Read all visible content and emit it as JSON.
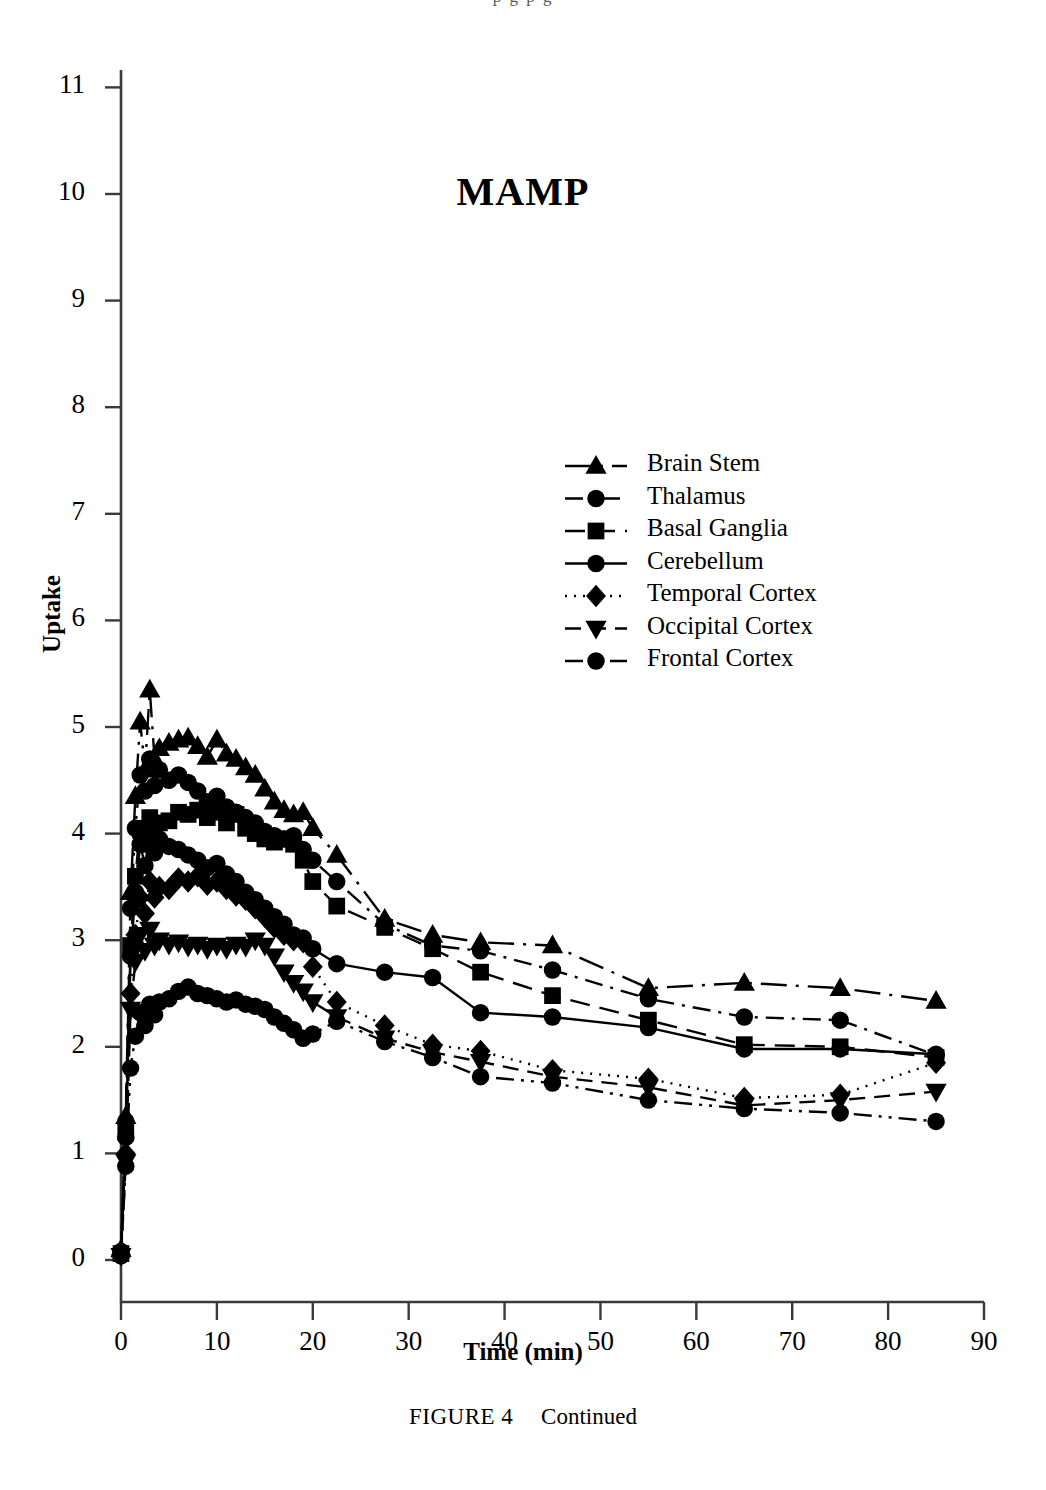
{
  "page": {
    "bleed_text": "p      g      p      g"
  },
  "figure": {
    "caption_label": "FIGURE 4",
    "caption_text": "Continued"
  },
  "chart_data": {
    "type": "line",
    "title": "MAMP",
    "xlabel": "Time (min)",
    "ylabel": "Uptake",
    "xlim": [
      0,
      90
    ],
    "ylim": [
      0,
      11.5
    ],
    "xticks": [
      0,
      10,
      20,
      30,
      40,
      50,
      60,
      70,
      80,
      90
    ],
    "yticks": [
      0,
      1,
      2,
      3,
      4,
      5,
      6,
      7,
      8,
      9,
      10,
      11
    ],
    "grid": false,
    "legend_position": "upper center",
    "color": "#000000",
    "series": [
      {
        "name": "Brain Stem",
        "marker": "triangle-up",
        "dash": "long-dash-dot",
        "x": [
          0,
          0.5,
          1,
          1.5,
          2,
          2.5,
          3,
          3.5,
          4,
          5,
          6,
          7,
          8,
          9,
          10,
          11,
          12,
          13,
          14,
          15,
          16,
          17,
          18,
          19,
          20,
          22.5,
          27.5,
          32.5,
          37.5,
          45,
          55,
          65,
          75,
          85
        ],
        "y": [
          0.1,
          1.35,
          3.45,
          4.35,
          5.05,
          4.6,
          5.35,
          4.7,
          4.8,
          4.85,
          4.88,
          4.9,
          4.82,
          4.72,
          4.88,
          4.75,
          4.7,
          4.62,
          4.55,
          4.42,
          4.3,
          4.22,
          4.18,
          4.2,
          4.05,
          3.8,
          3.2,
          3.05,
          2.98,
          2.95,
          2.55,
          2.6,
          2.55,
          2.43
        ]
      },
      {
        "name": "Thalamus",
        "marker": "circle",
        "dash": "dash-dot",
        "x": [
          0,
          0.5,
          1,
          1.5,
          2,
          2.5,
          3,
          3.5,
          4,
          5,
          6,
          7,
          8,
          9,
          10,
          11,
          12,
          13,
          14,
          15,
          16,
          17,
          18,
          19,
          20,
          22.5,
          27.5,
          32.5,
          37.5,
          45,
          55,
          65,
          75,
          85
        ],
        "y": [
          0.08,
          1.3,
          3.3,
          4.05,
          4.55,
          4.4,
          4.7,
          4.45,
          4.6,
          4.5,
          4.55,
          4.48,
          4.4,
          4.3,
          4.35,
          4.25,
          4.2,
          4.15,
          4.1,
          4.02,
          3.98,
          3.95,
          3.98,
          3.85,
          3.75,
          3.55,
          3.15,
          2.95,
          2.9,
          2.72,
          2.45,
          2.28,
          2.25,
          1.92
        ]
      },
      {
        "name": "Basal Ganglia",
        "marker": "square",
        "dash": "medium-dash",
        "x": [
          0,
          0.5,
          1,
          1.5,
          2,
          2.5,
          3,
          3.5,
          4,
          5,
          6,
          7,
          8,
          9,
          10,
          11,
          12,
          13,
          14,
          15,
          16,
          17,
          18,
          19,
          20,
          22.5,
          27.5,
          32.5,
          37.5,
          45,
          55,
          65,
          75,
          85
        ],
        "y": [
          0.06,
          1.2,
          2.95,
          3.6,
          4.05,
          3.9,
          4.15,
          4.0,
          4.1,
          4.12,
          4.2,
          4.18,
          4.22,
          4.15,
          4.2,
          4.1,
          4.18,
          4.05,
          4.0,
          3.95,
          3.92,
          3.95,
          3.9,
          3.75,
          3.55,
          3.32,
          3.12,
          2.92,
          2.7,
          2.48,
          2.25,
          2.02,
          2.0,
          1.9
        ]
      },
      {
        "name": "Cerebellum",
        "marker": "circle",
        "dash": "solid",
        "x": [
          0,
          0.5,
          1,
          1.5,
          2,
          2.5,
          3,
          3.5,
          4,
          5,
          6,
          7,
          8,
          9,
          10,
          11,
          12,
          13,
          14,
          15,
          16,
          17,
          18,
          19,
          20,
          22.5,
          27.5,
          32.5,
          37.5,
          45,
          55,
          65,
          75,
          85
        ],
        "y": [
          0.05,
          1.15,
          2.85,
          3.45,
          3.9,
          3.7,
          4.0,
          3.82,
          3.95,
          3.88,
          3.85,
          3.8,
          3.75,
          3.68,
          3.72,
          3.62,
          3.55,
          3.45,
          3.38,
          3.3,
          3.22,
          3.15,
          3.05,
          3.02,
          2.92,
          2.78,
          2.7,
          2.65,
          2.32,
          2.28,
          2.18,
          1.98,
          1.98,
          1.93
        ]
      },
      {
        "name": "Temporal Cortex",
        "marker": "diamond",
        "dash": "dotted",
        "x": [
          0,
          0.5,
          1,
          1.5,
          2,
          2.5,
          3,
          3.5,
          4,
          5,
          6,
          7,
          8,
          9,
          10,
          11,
          12,
          13,
          14,
          15,
          16,
          17,
          18,
          19,
          20,
          22.5,
          27.5,
          32.5,
          37.5,
          45,
          55,
          65,
          75,
          85
        ],
        "y": [
          0.05,
          1.0,
          2.5,
          3.05,
          3.4,
          3.25,
          3.55,
          3.4,
          3.5,
          3.48,
          3.58,
          3.55,
          3.6,
          3.52,
          3.55,
          3.48,
          3.42,
          3.38,
          3.3,
          3.22,
          3.12,
          3.05,
          3.0,
          2.98,
          2.75,
          2.42,
          2.2,
          2.02,
          1.96,
          1.78,
          1.7,
          1.52,
          1.55,
          1.85
        ]
      },
      {
        "name": "Occipital Cortex",
        "marker": "triangle-down",
        "dash": "dash",
        "x": [
          0,
          0.5,
          1,
          1.5,
          2,
          2.5,
          3,
          3.5,
          4,
          5,
          6,
          7,
          8,
          9,
          10,
          11,
          12,
          13,
          14,
          15,
          16,
          17,
          18,
          19,
          20,
          22.5,
          27.5,
          32.5,
          37.5,
          45,
          55,
          65,
          75,
          85
        ],
        "y": [
          0.04,
          0.92,
          2.35,
          2.8,
          3.05,
          2.9,
          3.1,
          2.95,
          3.0,
          2.96,
          2.98,
          2.94,
          2.96,
          2.92,
          2.95,
          2.92,
          2.96,
          2.94,
          3.0,
          2.95,
          2.85,
          2.7,
          2.6,
          2.52,
          2.42,
          2.28,
          2.08,
          1.95,
          1.86,
          1.72,
          1.62,
          1.45,
          1.5,
          1.58
        ]
      },
      {
        "name": "Frontal Cortex",
        "marker": "circle",
        "dash": "dash-dot-dot",
        "x": [
          0,
          0.5,
          1,
          1.5,
          2,
          2.5,
          3,
          3.5,
          4,
          5,
          6,
          7,
          8,
          9,
          10,
          11,
          12,
          13,
          14,
          15,
          16,
          17,
          18,
          19,
          20,
          22.5,
          27.5,
          32.5,
          37.5,
          45,
          55,
          65,
          75,
          85
        ],
        "y": [
          0.04,
          0.88,
          1.8,
          2.1,
          2.32,
          2.2,
          2.4,
          2.3,
          2.42,
          2.45,
          2.52,
          2.56,
          2.5,
          2.48,
          2.45,
          2.42,
          2.44,
          2.4,
          2.38,
          2.35,
          2.28,
          2.22,
          2.16,
          2.08,
          2.12,
          2.24,
          2.05,
          1.9,
          1.72,
          1.66,
          1.5,
          1.42,
          1.38,
          1.3
        ]
      }
    ]
  }
}
